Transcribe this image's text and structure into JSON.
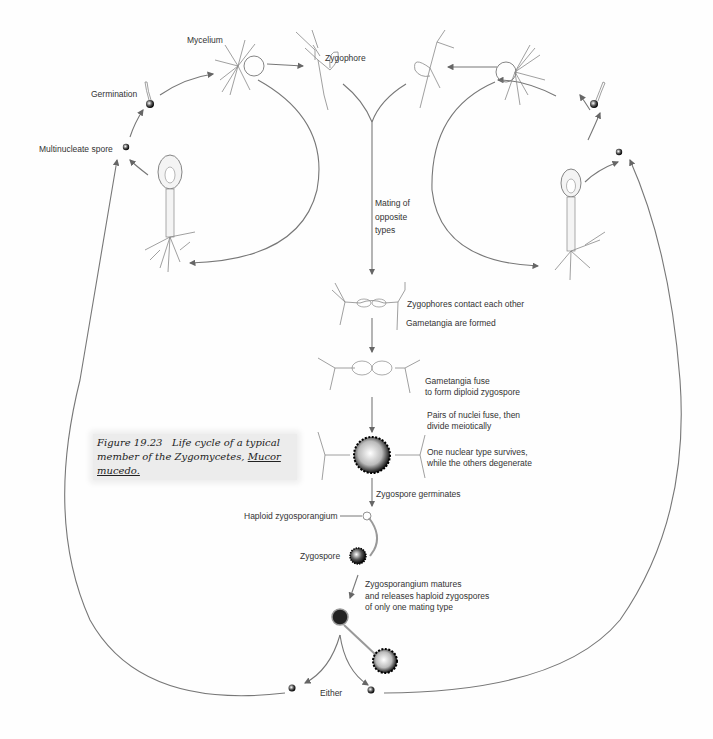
{
  "figure": {
    "caption_prefix": "Figure 19.23",
    "caption_text": "Life cycle of a typical member of the Zygomycetes,",
    "caption_species": "Mucor mucedo."
  },
  "labels": {
    "mycelium": "Mycelium",
    "zygophore": "Zygophore",
    "germination": "Germination",
    "multinucleate_spore": "Multinucleate spore",
    "mating_1": "Mating of",
    "mating_2": "opposite",
    "mating_3": "types",
    "zygophores_contact": "Zygophores contact each other",
    "gametangia_formed": "Gametangia are formed",
    "gametangia_fuse_1": "Gametangia fuse",
    "gametangia_fuse_2": "to form diploid zygospore",
    "nuclei_fuse_1": "Pairs of nuclei fuse, then",
    "nuclei_fuse_2": "divide meiotically",
    "nuclear_survives_1": "One nuclear type survives,",
    "nuclear_survives_2": "while the others degenerate",
    "zygospore_germinates": "Zygospore germinates",
    "haploid_zygosporangium": "Haploid zygosporangium",
    "zygospore": "Zygospore",
    "matures_1": "Zygosporangium matures",
    "matures_2": "and releases haploid zygospores",
    "matures_3": "of only one mating type",
    "either": "Either"
  }
}
